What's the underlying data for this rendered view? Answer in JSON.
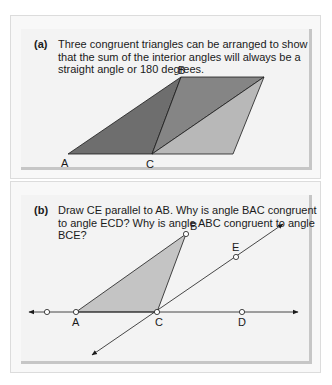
{
  "panel_a": {
    "label": "(a)",
    "text": "Three congruent triangles can be arranged to show that the sum of the interior angles will always be a straight angle or 180 degrees.",
    "points": {
      "A": "A",
      "B": "B",
      "C": "C"
    },
    "colors": {
      "left_triangle": "#6e6e6e",
      "middle_triangle": "#858585",
      "right_triangle": "#b8b8b8"
    }
  },
  "panel_b": {
    "label": "(b)",
    "text": "Draw CE parallel to AB. Why is angle BAC congruent to angle ECD? Why is angle ABC congruent to angle BCE?",
    "points": {
      "A": "A",
      "B": "B",
      "C": "C",
      "D": "D",
      "E": "E"
    },
    "colors": {
      "triangle": "#c4c4c4"
    }
  }
}
